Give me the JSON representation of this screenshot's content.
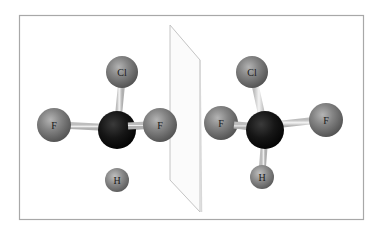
{
  "figure": {
    "frame": {
      "x": 19,
      "y": 15,
      "width": 344,
      "height": 204,
      "stroke": "#a8a8a8"
    },
    "mirror_plane": {
      "points": "170,25 200,60 200,212 170,180",
      "stroke": "#c8c8c8"
    },
    "colors": {
      "halogen": "#7a7a7a",
      "carbon": "#141414",
      "hydrogen": "#8a8a8a",
      "bond": "#e4e4e4",
      "label": "#1a1a1a"
    }
  },
  "molecules": [
    {
      "name": "left-molecule",
      "atoms": [
        {
          "id": "cl",
          "label": "Cl",
          "cx": 122,
          "cy": 72,
          "r": 16,
          "type": "halogen"
        },
        {
          "id": "f1",
          "label": "F",
          "cx": 54,
          "cy": 125,
          "r": 17,
          "type": "halogen"
        },
        {
          "id": "f2",
          "label": "F",
          "cx": 160,
          "cy": 125,
          "r": 17,
          "type": "halogen"
        },
        {
          "id": "h",
          "label": "H",
          "cx": 117,
          "cy": 180,
          "r": 12,
          "type": "hydrogen"
        },
        {
          "id": "c",
          "label": "",
          "cx": 117,
          "cy": 130,
          "r": 19,
          "type": "carbon"
        }
      ]
    },
    {
      "name": "right-molecule",
      "atoms": [
        {
          "id": "cl",
          "label": "Cl",
          "cx": 252,
          "cy": 72,
          "r": 16,
          "type": "halogen"
        },
        {
          "id": "f1",
          "label": "F",
          "cx": 221,
          "cy": 123,
          "r": 17,
          "type": "halogen"
        },
        {
          "id": "f2",
          "label": "F",
          "cx": 326,
          "cy": 120,
          "r": 17,
          "type": "halogen"
        },
        {
          "id": "h",
          "label": "H",
          "cx": 262,
          "cy": 177,
          "r": 12,
          "type": "hydrogen"
        },
        {
          "id": "c",
          "label": "",
          "cx": 265,
          "cy": 130,
          "r": 19,
          "type": "carbon"
        }
      ]
    }
  ],
  "labels": {
    "left": {
      "cl": "Cl",
      "f1": "F",
      "f2": "F",
      "h": "H"
    },
    "right": {
      "cl": "Cl",
      "f1": "F",
      "f2": "F",
      "h": "H"
    }
  }
}
